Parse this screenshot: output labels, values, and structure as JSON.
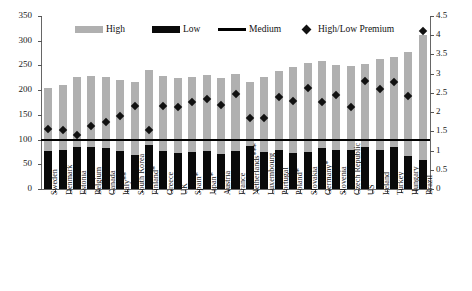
{
  "chart_data": {
    "type": "bar",
    "title": "",
    "xlabel": "",
    "ylabel": "",
    "ylim": [
      0,
      350
    ],
    "y2lim": [
      0,
      4.5
    ],
    "grid": false,
    "legend_position": "top",
    "categories": [
      "Sweden",
      "Denmark",
      "Estonia",
      "Belgium",
      "Canada",
      "Italy**",
      "South Korea",
      "Finland*",
      "Greece",
      "UK",
      "Spain*",
      "Japan*",
      "Austria",
      "France",
      "Netherlands***",
      "Luxembourg",
      "Portugal",
      "Poland*",
      "Slovakia",
      "Germany*",
      "Slovenia",
      "Czech Republic",
      "US",
      "Ireland",
      "Turkey",
      "Hungary",
      "Brazil"
    ],
    "yticks": [
      "0",
      "50",
      "100",
      "150",
      "200",
      "250",
      "300",
      "350"
    ],
    "y2ticks": [
      "0",
      "0.5",
      "1",
      "1.5",
      "2",
      "2.5",
      "3",
      "3.5",
      "4",
      "4.5"
    ],
    "series": [
      {
        "name": "High",
        "axis": "left",
        "color": "#b0b0b0",
        "values": [
          204,
          211,
          226,
          228,
          227,
          221,
          216,
          240,
          228,
          225,
          227,
          230,
          224,
          232,
          217,
          226,
          238,
          247,
          255,
          258,
          250,
          249,
          252,
          264,
          268,
          278,
          312
        ]
      },
      {
        "name": "Low",
        "axis": "left",
        "color": "#0a0a0a",
        "values": [
          76,
          79,
          84,
          86,
          83,
          76,
          69,
          89,
          76,
          73,
          75,
          76,
          71,
          77,
          88,
          74,
          78,
          72,
          74,
          82,
          79,
          79,
          85,
          78,
          85,
          66,
          58
        ]
      },
      {
        "name": "Medium",
        "axis": "left",
        "color": "#000000",
        "type": "line",
        "value": 100
      },
      {
        "name": "High/Low Premium",
        "axis": "right",
        "color": "#111111",
        "type": "scatter",
        "values": [
          1.65,
          1.62,
          1.48,
          1.72,
          1.83,
          1.98,
          2.25,
          1.62,
          2.25,
          2.22,
          2.33,
          2.43,
          2.27,
          2.55,
          1.92,
          1.93,
          2.48,
          2.37,
          2.7,
          2.34,
          2.52,
          2.22,
          2.9,
          2.68,
          2.85,
          2.5,
          4.2
        ]
      }
    ],
    "legend": [
      {
        "label": "High",
        "marker": "bar-gray"
      },
      {
        "label": "Low",
        "marker": "bar-black"
      },
      {
        "label": "Medium",
        "marker": "line-black"
      },
      {
        "label": "High/Low Premium",
        "marker": "diamond-black"
      }
    ]
  }
}
